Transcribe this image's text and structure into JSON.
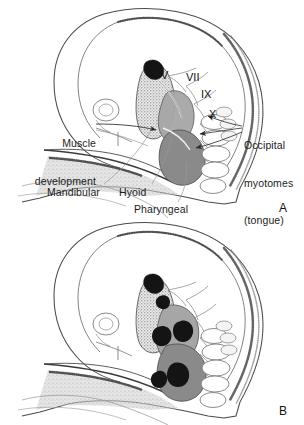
{
  "figure": {
    "background_color": "#ffffff",
    "ink_color": "#1c1c1c"
  },
  "panels": [
    {
      "id": "A",
      "letter": "A",
      "description": "Lateral view of embryonic head showing pharyngeal arches, cranial nerves and occipital myotomes",
      "labels": [
        {
          "name": "muscle-development",
          "lines": [
            "Muscle",
            "development"
          ],
          "align": "right",
          "x": 12,
          "y": 112
        },
        {
          "name": "occipital-myotomes",
          "lines": [
            "Occipital",
            "myotomes",
            "(tongue)"
          ],
          "align": "left",
          "x": 244,
          "y": 114
        },
        {
          "name": "mandibular",
          "lines": [
            "Mandibular"
          ],
          "align": "left",
          "x": 47,
          "y": 186
        },
        {
          "name": "hyoid",
          "lines": [
            "Hyoid"
          ],
          "align": "left",
          "x": 119,
          "y": 186
        },
        {
          "name": "pharyngeal",
          "lines": [
            "Pharyngeal"
          ],
          "align": "left",
          "x": 134,
          "y": 203
        }
      ],
      "nerve_labels": [
        {
          "name": "cranial-nerve-v",
          "text": "V",
          "x": 161,
          "y": 70
        },
        {
          "name": "cranial-nerve-vii",
          "text": "VII",
          "x": 186,
          "y": 72
        },
        {
          "name": "cranial-nerve-ix",
          "text": "IX",
          "x": 201,
          "y": 89
        },
        {
          "name": "cranial-nerve-x",
          "text": "X",
          "x": 209,
          "y": 109
        }
      ],
      "letter_position": {
        "x": 279,
        "y": 202
      }
    },
    {
      "id": "B",
      "letter": "B",
      "description": "Lateral view of embryonic head at a later stage showing condensed muscle masses within the arches",
      "labels": [],
      "nerve_labels": [],
      "letter_position": {
        "x": 279,
        "y": 405
      }
    }
  ],
  "colors": {
    "outline": "#3b3b3b",
    "fine_line": "#8c8c8c",
    "arch1_mandibular": "#b9b9b9",
    "arch2_hyoid": "#a0a0a0",
    "arch3_pharyngeal": "#8a8a8a",
    "muscle_mass": "#161616",
    "stipple": "#6e6e6e",
    "background": "#ffffff"
  }
}
